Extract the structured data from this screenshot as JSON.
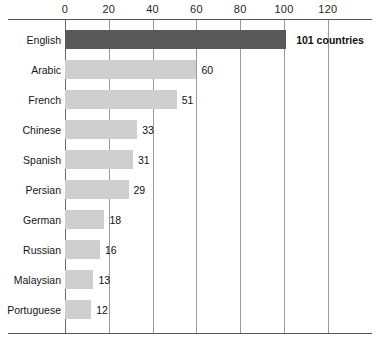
{
  "chart_data": {
    "type": "bar",
    "orientation": "horizontal",
    "title": "",
    "subtitle": "",
    "xlabel": "",
    "ylabel": "",
    "categories": [
      "English",
      "Arabic",
      "French",
      "Chinese",
      "Spanish",
      "Persian",
      "German",
      "Russian",
      "Malaysian",
      "Portuguese"
    ],
    "values": [
      101,
      60,
      51,
      33,
      31,
      29,
      18,
      16,
      13,
      12
    ],
    "value_labels": [
      "101 countries",
      "60",
      "51",
      "33",
      "31",
      "29",
      "18",
      "16",
      "13",
      "12"
    ],
    "highlight_index": 0,
    "xlim": [
      0,
      131
    ],
    "xticks": [
      0,
      20,
      40,
      60,
      80,
      100,
      120
    ],
    "xtick_labels": [
      "0",
      "20",
      "40",
      "60",
      "80",
      "100",
      "120"
    ],
    "grid": true,
    "grid_axis": "x",
    "legend": false,
    "legend_position": "none",
    "colors": {
      "bar": "#cfcfcf",
      "bar_highlight": "#595959",
      "gridline": "#9a9a9a",
      "axis_rule": "#555555",
      "text": "#151515",
      "background": "#ffffff"
    }
  }
}
